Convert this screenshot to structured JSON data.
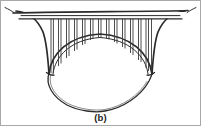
{
  "figure": {
    "caption": "(b)",
    "kind": "line-drawing",
    "ink_color": "#2b2b2b",
    "background_color": "#ffffff",
    "border_color": "#a8a8a8",
    "canvas": {
      "width": 201,
      "height": 126
    }
  },
  "parts": {
    "deck_label": "bridge-deck",
    "arch_label": "arch-rib",
    "hangers_label": "spandrel-columns",
    "abutment_left_label": "left-abutment-flare",
    "abutment_right_label": "right-abutment-flare",
    "reflection_label": "lower-outline"
  },
  "geometry": {
    "deck_top_y": 11,
    "deck_bottom_y": 17,
    "deck_left_x": 14,
    "deck_right_x": 186,
    "arch_crown_y": 34,
    "arch_springing_y": 73,
    "arch_left_x": 50,
    "arch_right_x": 152,
    "hanger_count": 19,
    "lower_outline_bottom_y": 110
  },
  "hangers": {
    "x_positions": [
      50,
      55.5,
      61,
      66.5,
      72,
      77.5,
      83,
      88.5,
      94,
      99.5,
      105,
      110.5,
      116,
      121.5,
      127,
      132.5,
      138,
      143.5,
      149
    ]
  }
}
